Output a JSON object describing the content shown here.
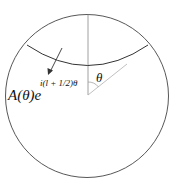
{
  "diagram": {
    "labels": {
      "amplitude": "A(θ)e",
      "exponent": "i(l + 1/2)θ",
      "angle": "θ"
    },
    "colors": {
      "circle": "#444444",
      "wavefront": "#333333",
      "axis": "#888888",
      "ray": "#b0b0b0",
      "arrow": "#333333",
      "text": "#111111"
    }
  }
}
